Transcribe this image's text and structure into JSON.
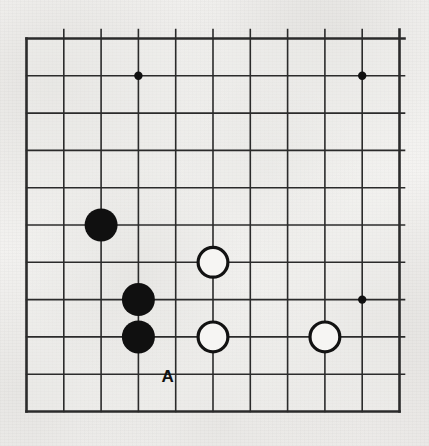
{
  "diagram": {
    "type": "go-board-diagram",
    "board": {
      "visible_columns": 11,
      "visible_rows": 11,
      "grid_spacing_px": 37.3,
      "origin_x_px": 26.5,
      "origin_y_px": 38.5,
      "line_color": "#2b2b2b",
      "border_color": "#1f1f1f",
      "background_color": "#f2f1ef",
      "line_width_px": 1.6,
      "border_width_px": 2.6
    },
    "star_points": [
      {
        "col": 3,
        "row": 1,
        "name": "star-point-top-left"
      },
      {
        "col": 9,
        "row": 1,
        "name": "star-point-top-right"
      },
      {
        "col": 9,
        "row": 7,
        "name": "star-point-bottom-right"
      }
    ],
    "stones": [
      {
        "color": "black",
        "col": 2,
        "row": 5,
        "name": "black-stone-c5"
      },
      {
        "color": "black",
        "col": 3,
        "row": 7,
        "name": "black-stone-d7"
      },
      {
        "color": "black",
        "col": 3,
        "row": 8,
        "name": "black-stone-d8"
      },
      {
        "color": "white",
        "col": 5,
        "row": 6,
        "name": "white-stone-f6"
      },
      {
        "color": "white",
        "col": 5,
        "row": 8,
        "name": "white-stone-f8"
      },
      {
        "color": "white",
        "col": 8,
        "row": 8,
        "name": "white-stone-i8"
      }
    ],
    "stone_style": {
      "radius_px": 16.5,
      "black_fill": "#101010",
      "white_fill": "#f6f5f3",
      "white_stroke": "#121212",
      "white_stroke_width_px": 3.2,
      "star_point_radius_px": 4.2
    },
    "annotations": [
      {
        "text": "A",
        "col": 4,
        "row": 9,
        "offset_x_px": -8,
        "offset_y_px": 2,
        "name": "point-label-a"
      }
    ]
  }
}
